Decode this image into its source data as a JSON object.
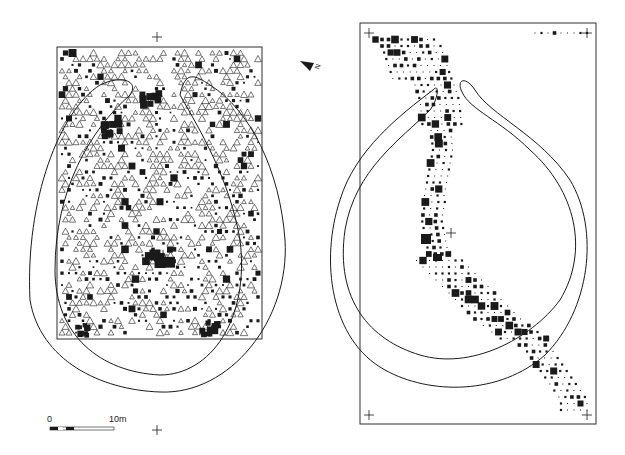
{
  "figure": {
    "width": 625,
    "height": 455,
    "ink_color": "#1a1a1a",
    "paper_color": "#ffffff"
  },
  "north_arrow": {
    "label": "N",
    "x": 312,
    "y": 65,
    "icon": "north-arrow-icon"
  },
  "scale_bar": {
    "start_label": "0",
    "end_label": "10m",
    "x": 50,
    "y": 427,
    "length_px": 64,
    "segments": 8
  },
  "left_plan": {
    "name": "excavation-area-plan",
    "rect": {
      "x": 57,
      "y": 47,
      "w": 205,
      "h": 292
    },
    "grid_crosses": [
      {
        "x": 157,
        "y": 37
      },
      {
        "x": 157,
        "y": 430
      },
      {
        "x": 163,
        "y": 255
      }
    ],
    "symbols": {
      "triangle": "open-triangle",
      "square": "filled-square"
    },
    "dense_clusters": [
      {
        "x": 157,
        "y": 258,
        "size": 9
      },
      {
        "x": 112,
        "y": 130,
        "size": 6
      },
      {
        "x": 150,
        "y": 100,
        "size": 6
      },
      {
        "x": 210,
        "y": 328,
        "size": 6
      },
      {
        "x": 80,
        "y": 330,
        "size": 5
      }
    ],
    "ring_outer": "M 100 85 C 60 110, 25 200, 30 300 C 40 360, 100 390, 160 392 C 230 395, 290 320, 285 240 C 280 170, 250 110, 210 85 C 195 75, 185 70, 180 95 C 200 130, 230 180, 240 240 C 250 320, 210 375, 160 375 C 100 372, 55 335, 55 270 C 55 190, 90 130, 130 95 C 140 80, 120 75, 100 85 Z",
    "ring_inner": "M 115 98 C 80 120, 50 180, 48 260 C 50 330, 95 365, 160 368"
  },
  "right_plan": {
    "name": "trench-section-plan",
    "rect": {
      "x": 360,
      "y": 23,
      "w": 236,
      "h": 401
    },
    "grid_crosses": [
      {
        "x": 369,
        "y": 33
      },
      {
        "x": 587,
        "y": 33
      },
      {
        "x": 369,
        "y": 415
      },
      {
        "x": 587,
        "y": 415
      },
      {
        "x": 451,
        "y": 233
      }
    ],
    "symbols": {
      "square": "graduated-filled-square"
    },
    "ring_outer": "M 433 90 C 440 82, 438 100, 430 110 C 400 140, 355 170, 345 230 C 335 300, 370 340, 420 355 C 470 370, 530 340, 560 300 C 590 250, 575 190, 530 150 C 500 120, 470 110, 462 92 C 456 80, 465 75, 475 90 C 490 115, 540 135, 570 180 C 600 230, 590 310, 545 355 C 500 395, 430 395, 385 370 C 330 340, 320 260, 340 200 C 355 150, 400 115, 433 90 Z",
    "trench_band": {
      "points": [
        [
          375,
          35
        ],
        [
          420,
          40
        ],
        [
          440,
          100
        ],
        [
          445,
          150
        ],
        [
          432,
          220
        ],
        [
          440,
          260
        ],
        [
          470,
          290
        ],
        [
          500,
          320
        ],
        [
          540,
          350
        ],
        [
          575,
          400
        ]
      ]
    }
  }
}
